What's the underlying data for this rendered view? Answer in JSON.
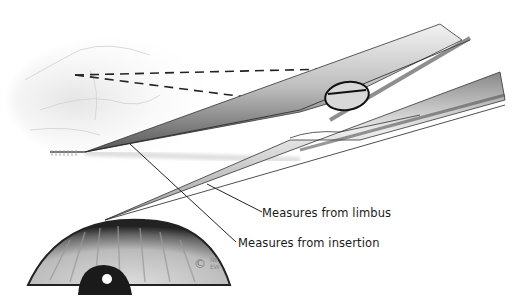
{
  "figure": {
    "labels": {
      "limbus": "Measures from limbus",
      "insertion": "Measures from insertion"
    },
    "copyright": "©",
    "signature_top": "NE",
    "signature_bottom": "EW",
    "colors": {
      "background": "#ffffff",
      "ink": "#1a1a1a",
      "metal_light": "#e6e6e6",
      "metal_dark": "#4a4a4a"
    }
  }
}
